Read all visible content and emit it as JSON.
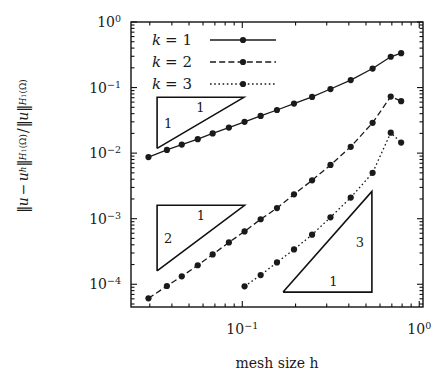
{
  "chart_data": {
    "type": "line",
    "title": "",
    "xlabel": "mesh size h",
    "ylabel": "||u - u_h||_{H^1(Omega)} / ||u||_{H^1(Omega)}",
    "xscale": "log",
    "yscale": "log",
    "xlim": [
      0.0235,
      1.05
    ],
    "ylim": [
      4.5e-05,
      1.0
    ],
    "xticks": [
      0.1,
      1.0
    ],
    "xticklabels": [
      "10^-1",
      "10^0"
    ],
    "yticks": [
      1.0,
      0.1,
      0.01,
      0.001,
      0.0001
    ],
    "yticklabels": [
      "10^0",
      "10^-1",
      "10^-2",
      "10^-3",
      "10^-4"
    ],
    "grid": false,
    "legend_position": "top-left",
    "series": [
      {
        "name": "k = 1",
        "linestyle": "solid",
        "marker": "filled-circle",
        "color": "#1a1a1a",
        "x": [
          0.0295,
          0.0375,
          0.0455,
          0.056,
          0.068,
          0.084,
          0.103,
          0.127,
          0.157,
          0.196,
          0.248,
          0.315,
          0.41,
          0.545,
          0.69,
          0.79
        ],
        "y": [
          0.0087,
          0.0112,
          0.0135,
          0.0163,
          0.02,
          0.0245,
          0.03,
          0.037,
          0.0455,
          0.057,
          0.072,
          0.095,
          0.13,
          0.195,
          0.295,
          0.335
        ]
      },
      {
        "name": "k = 2",
        "linestyle": "dashed",
        "marker": "filled-circle",
        "color": "#1a1a1a",
        "x": [
          0.0295,
          0.0375,
          0.0455,
          0.056,
          0.068,
          0.084,
          0.103,
          0.127,
          0.157,
          0.196,
          0.248,
          0.315,
          0.41,
          0.545,
          0.69,
          0.79
        ],
        "y": [
          6.1e-05,
          9.4e-05,
          0.000132,
          0.000195,
          0.000285,
          0.000435,
          0.00064,
          0.00098,
          0.00145,
          0.00235,
          0.00385,
          0.0066,
          0.0125,
          0.029,
          0.073,
          0.062
        ]
      },
      {
        "name": "k = 3",
        "linestyle": "dotted",
        "marker": "filled-circle",
        "color": "#1a1a1a",
        "x": [
          0.103,
          0.127,
          0.157,
          0.196,
          0.248,
          0.315,
          0.41,
          0.545,
          0.69,
          0.79
        ],
        "y": [
          9.3e-05,
          0.000138,
          0.000215,
          0.00034,
          0.00057,
          0.00105,
          0.0021,
          0.005,
          0.0205,
          0.0145
        ]
      }
    ],
    "annotations": [
      {
        "name": "slope-triangle-1",
        "vertical_label": "1",
        "horizontal_label": "1",
        "slope": 1,
        "orientation": "upper-left",
        "x0": 0.033,
        "x1": 0.102,
        "y_left": 0.0118,
        "y_right": 0.071
      },
      {
        "name": "slope-triangle-2",
        "vertical_label": "2",
        "horizontal_label": "1",
        "slope": 2,
        "orientation": "upper-left",
        "x0": 0.033,
        "x1": 0.103,
        "y_left": 0.00016,
        "y_right": 0.0016
      },
      {
        "name": "slope-triangle-3",
        "vertical_label": "3",
        "horizontal_label": "1",
        "slope": 3,
        "orientation": "lower-right",
        "x0": 0.17,
        "x1": 0.54,
        "y_low": 7.6e-05,
        "y_high": 0.0026
      }
    ],
    "legend": [
      {
        "label": "k = 1",
        "linestyle": "solid"
      },
      {
        "label": "k = 2",
        "linestyle": "dashed"
      },
      {
        "label": "k = 3",
        "linestyle": "dotted"
      }
    ]
  },
  "axes": {
    "x_label_text": "mesh size h",
    "x_tick_labels": [
      "10",
      "-1",
      "10",
      "0"
    ],
    "y_tick_labels": [
      {
        "base": "10",
        "exp": "0"
      },
      {
        "base": "10",
        "exp": "−1"
      },
      {
        "base": "10",
        "exp": "−2"
      },
      {
        "base": "10",
        "exp": "−3"
      },
      {
        "base": "10",
        "exp": "−4"
      }
    ]
  },
  "ylabel_parts": {
    "bar1": "‖",
    "u1": "u",
    "minus": "−",
    "uh": "u",
    "h": "h",
    "bar2": "‖",
    "H1a": "H",
    "one_a": "1",
    "omega_a": "(Ω)",
    "slash": "/",
    "bar3": "‖",
    "u2": "u",
    "bar4": "‖",
    "H1b": "H",
    "one_b": "1",
    "omega_b": "(Ω)"
  },
  "legend_labels": {
    "k1": {
      "k": "k",
      "eq": "= 1"
    },
    "k2": {
      "k": "k",
      "eq": "= 2"
    },
    "k3": {
      "k": "k",
      "eq": "= 3"
    }
  },
  "triangle_labels": {
    "t1_v": "1",
    "t1_h": "1",
    "t2_v": "2",
    "t2_h": "1",
    "t3_v": "3",
    "t3_h": "1"
  },
  "colors": {
    "ink": "#1a1a1a",
    "background": "#ffffff",
    "frame": "#111111"
  }
}
